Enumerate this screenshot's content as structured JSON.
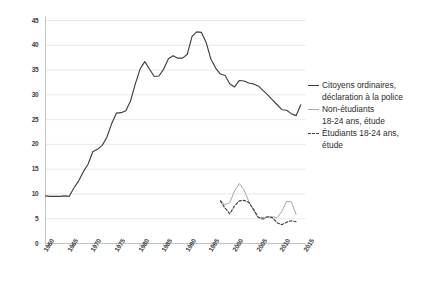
{
  "chart_data": {
    "type": "line",
    "title": "",
    "xlabel": "",
    "ylabel": "",
    "xlim": [
      1960,
      2015
    ],
    "ylim": [
      0,
      45
    ],
    "yticks": [
      0,
      5,
      10,
      15,
      20,
      25,
      30,
      35,
      40,
      45
    ],
    "xticks": [
      1960,
      1965,
      1970,
      1975,
      1980,
      1985,
      1990,
      1995,
      2000,
      2005,
      2010,
      2015
    ],
    "grid": "horizontal",
    "legend_position": "right",
    "series": [
      {
        "name": "Citoyens ordinaires, déclaration à la police",
        "style": "solid",
        "color": "#3f3f3f",
        "x": [
          1960,
          1961,
          1962,
          1963,
          1964,
          1965,
          1966,
          1967,
          1968,
          1969,
          1970,
          1971,
          1972,
          1973,
          1974,
          1975,
          1976,
          1977,
          1978,
          1979,
          1980,
          1981,
          1982,
          1983,
          1984,
          1985,
          1986,
          1987,
          1988,
          1989,
          1990,
          1991,
          1992,
          1993,
          1994,
          1995,
          1996,
          1997,
          1998,
          1999,
          2000,
          2001,
          2002,
          2003,
          2004,
          2005,
          2006,
          2007,
          2008,
          2009,
          2010,
          2011,
          2012,
          2013,
          2014
        ],
        "values": [
          9.6,
          9.5,
          9.5,
          9.5,
          9.6,
          9.5,
          11.2,
          12.6,
          14.5,
          16.0,
          18.5,
          19.0,
          19.8,
          21.5,
          24.2,
          26.3,
          26.4,
          26.8,
          28.8,
          32.2,
          35.2,
          36.7,
          35.2,
          33.7,
          33.8,
          35.2,
          37.3,
          37.9,
          37.4,
          37.4,
          38.2,
          41.8,
          42.7,
          42.6,
          40.5,
          37.2,
          35.4,
          34.2,
          33.9,
          32.2,
          31.6,
          32.9,
          32.8,
          32.4,
          32.2,
          31.8,
          30.9,
          30.0,
          29.0,
          28.0,
          27.0,
          26.9,
          26.2,
          25.8,
          28.0
        ]
      },
      {
        "name": "Non-étudiants 18-24 ans, étude",
        "style": "solid",
        "color": "#a6a6a6",
        "x": [
          1997,
          1998,
          1999,
          2000,
          2001,
          2002,
          2003,
          2004,
          2005,
          2006,
          2007,
          2008,
          2009,
          2010,
          2011,
          2012,
          2013
        ],
        "values": [
          8.7,
          7.8,
          8.3,
          10.6,
          12.1,
          10.8,
          8.5,
          6.7,
          5.2,
          4.8,
          5.4,
          5.4,
          5.2,
          6.5,
          8.5,
          8.4,
          5.9
        ]
      },
      {
        "name": "Étudiants 18-24 ans, étude",
        "style": "dashed",
        "color": "#3f3f3f",
        "x": [
          1997,
          1998,
          1999,
          2000,
          2001,
          2002,
          2003,
          2004,
          2005,
          2006,
          2007,
          2008,
          2009,
          2010,
          2011,
          2012,
          2013
        ],
        "values": [
          8.6,
          7.1,
          6.0,
          7.6,
          8.6,
          8.7,
          8.3,
          6.9,
          5.3,
          5.1,
          5.4,
          5.2,
          4.2,
          3.8,
          4.3,
          4.6,
          4.4
        ]
      }
    ]
  },
  "axes": {
    "yticks": [
      "0",
      "5",
      "10",
      "15",
      "20",
      "25",
      "30",
      "35",
      "40",
      "45"
    ],
    "xticks": [
      "1960",
      "1965",
      "1970",
      "1975",
      "1980",
      "1985",
      "1990",
      "1995",
      "2000",
      "2005",
      "2010",
      "2015"
    ]
  },
  "legend": {
    "items": [
      {
        "marker": "solid-dark",
        "line1": "Citoyens ordinaires,",
        "line2": "déclaration à la police"
      },
      {
        "marker": "solid-gray",
        "line1": "Non-étudiants",
        "line2": "18-24 ans, étude"
      },
      {
        "marker": "dashed-dark",
        "line1": "Étudiants 18-24 ans,",
        "line2": "étude"
      }
    ]
  }
}
